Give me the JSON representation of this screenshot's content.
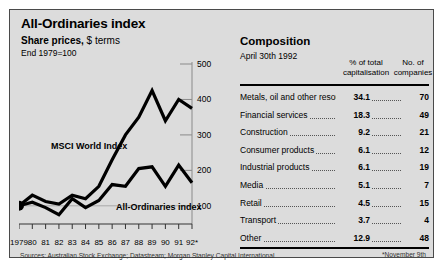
{
  "chart_panel": {
    "title": "All-Ordinaries index",
    "subtitle_bold": "Share prices,",
    "subtitle_rest": " $ terms",
    "subtitle2": "End 1979=100",
    "sources": "Sources: Australian Stock Exchange; Datastream; Morgan Stanley Capital International"
  },
  "composition": {
    "title": "Composition",
    "date": "April 30th 1992",
    "header_pct": "% of total capitalisation",
    "header_num": "No. of companies",
    "footnote": "*November 9th",
    "rows": [
      {
        "name": "Metals, oil and other resources",
        "pct": "34.1",
        "num": "70"
      },
      {
        "name": "Financial services",
        "pct": "18.3",
        "num": "49"
      },
      {
        "name": "Construction",
        "pct": "9.2",
        "num": "21"
      },
      {
        "name": "Consumer products",
        "pct": "6.1",
        "num": "12"
      },
      {
        "name": "Industrial products",
        "pct": "6.1",
        "num": "19"
      },
      {
        "name": "Media",
        "pct": "5.1",
        "num": "7"
      },
      {
        "name": "Retail",
        "pct": "4.5",
        "num": "15"
      },
      {
        "name": "Transport",
        "pct": "3.7",
        "num": "4"
      },
      {
        "name": "Other",
        "pct": "12.9",
        "num": "48"
      }
    ]
  },
  "chart_data": {
    "type": "line",
    "title": "All-Ordinaries index",
    "subtitle": "Share prices, $ terms. End 1979=100",
    "xlabel": "",
    "ylabel": "",
    "ylim": [
      60,
      500
    ],
    "yticks": [
      100,
      200,
      300,
      400,
      500
    ],
    "grid": false,
    "legend": "inline-labels",
    "x": [
      "1979",
      "80",
      "81",
      "82",
      "83",
      "84",
      "85",
      "86",
      "87",
      "88",
      "89",
      "90",
      "91",
      "92*"
    ],
    "series": [
      {
        "name": "MSCI World Index",
        "color": "#000000",
        "values": [
          100,
          130,
          112,
          105,
          130,
          120,
          155,
          230,
          300,
          350,
          425,
          340,
          400,
          375
        ]
      },
      {
        "name": "All-Ordinaries index",
        "color": "#000000",
        "values": [
          100,
          110,
          95,
          75,
          120,
          95,
          115,
          160,
          155,
          205,
          210,
          155,
          215,
          165
        ]
      }
    ],
    "annotations": [
      {
        "text": "MSCI World Index",
        "series": "MSCI World Index"
      },
      {
        "text": "All-Ordinaries index",
        "series": "All-Ordinaries index"
      }
    ],
    "markers": [
      {
        "x": "1979",
        "y": 100,
        "style": "filled-circle"
      }
    ]
  }
}
